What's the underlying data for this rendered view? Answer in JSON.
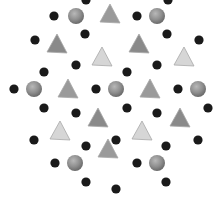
{
  "image": {
    "width": 216,
    "height": 206,
    "background": "#ffffff",
    "description": "Crystal lattice-style pattern of gray spheres, black dots and gray triangles"
  },
  "colors": {
    "sphere_fill": "#8c8c8c",
    "sphere_highlight": "#b4b4b4",
    "sphere_shadow": "#6a6a6a",
    "dot": "#1a1a1a",
    "triangle_mid": "#9a9a9a",
    "triangle_dark": "#8a8a8a",
    "triangle_light": "#d6d6d6",
    "triangle_edge": "#a8a8a8"
  },
  "spheres": [
    {
      "x": 76,
      "y": 16
    },
    {
      "x": 157,
      "y": 16
    },
    {
      "x": 34,
      "y": 89
    },
    {
      "x": 116,
      "y": 89
    },
    {
      "x": 198,
      "y": 89
    },
    {
      "x": 75,
      "y": 163
    },
    {
      "x": 157,
      "y": 163
    }
  ],
  "dots": [
    {
      "x": 86,
      "y": 0
    },
    {
      "x": 168,
      "y": 0
    },
    {
      "x": 54,
      "y": 16
    },
    {
      "x": 137,
      "y": 16
    },
    {
      "x": 35,
      "y": 40
    },
    {
      "x": 85,
      "y": 34
    },
    {
      "x": 167,
      "y": 34
    },
    {
      "x": 199,
      "y": 40
    },
    {
      "x": 76,
      "y": 65
    },
    {
      "x": 44,
      "y": 72
    },
    {
      "x": 157,
      "y": 65
    },
    {
      "x": 127,
      "y": 72
    },
    {
      "x": 14,
      "y": 89
    },
    {
      "x": 96,
      "y": 89
    },
    {
      "x": 178,
      "y": 89
    },
    {
      "x": 44,
      "y": 108
    },
    {
      "x": 76,
      "y": 113
    },
    {
      "x": 127,
      "y": 108
    },
    {
      "x": 157,
      "y": 113
    },
    {
      "x": 208,
      "y": 108
    },
    {
      "x": 34,
      "y": 140
    },
    {
      "x": 86,
      "y": 146
    },
    {
      "x": 116,
      "y": 140
    },
    {
      "x": 166,
      "y": 146
    },
    {
      "x": 198,
      "y": 140
    },
    {
      "x": 55,
      "y": 163
    },
    {
      "x": 137,
      "y": 163
    },
    {
      "x": 86,
      "y": 182
    },
    {
      "x": 166,
      "y": 182
    },
    {
      "x": 116,
      "y": 189
    }
  ],
  "triangles": [
    {
      "x": 110,
      "y": 14,
      "tone": "mid"
    },
    {
      "x": 57,
      "y": 44,
      "tone": "dark"
    },
    {
      "x": 139,
      "y": 44,
      "tone": "dark"
    },
    {
      "x": 102,
      "y": 57,
      "tone": "light"
    },
    {
      "x": 184,
      "y": 57,
      "tone": "light"
    },
    {
      "x": 68,
      "y": 89,
      "tone": "mid"
    },
    {
      "x": 150,
      "y": 89,
      "tone": "mid"
    },
    {
      "x": 98,
      "y": 118,
      "tone": "dark"
    },
    {
      "x": 180,
      "y": 118,
      "tone": "dark"
    },
    {
      "x": 60,
      "y": 131,
      "tone": "light"
    },
    {
      "x": 142,
      "y": 131,
      "tone": "light"
    },
    {
      "x": 108,
      "y": 149,
      "tone": "mid"
    }
  ]
}
